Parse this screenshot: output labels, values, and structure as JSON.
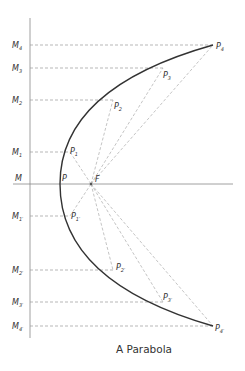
{
  "title": "A Parabola",
  "colors": {
    "curve": "#333333",
    "axis": "#888888",
    "dashed": "#999999",
    "text": "#333333"
  },
  "geometry": {
    "vertex": {
      "x": 60,
      "y": 184
    },
    "focus": {
      "x": 91,
      "y": 184
    },
    "directrix_x": 30,
    "axis_y": 184
  },
  "labels": {
    "vertex": "P",
    "focus": "F",
    "axis_origin": "M",
    "upper": [
      {
        "m": "M",
        "m_sub": "1",
        "p": "P",
        "p_sub": "1",
        "px": 70,
        "y": 152
      },
      {
        "m": "M",
        "m_sub": "2",
        "p": "P",
        "p_sub": "2",
        "px": 113,
        "y": 100
      },
      {
        "m": "M",
        "m_sub": "3",
        "p": "P",
        "p_sub": "3",
        "px": 163,
        "y": 68
      },
      {
        "m": "M",
        "m_sub": "4",
        "p": "P",
        "p_sub": "4",
        "px": 213,
        "y": 45
      }
    ],
    "lower": [
      {
        "m": "M",
        "m_sub": "1′",
        "p": "P",
        "p_sub": "1′",
        "px": 70,
        "y": 216
      },
      {
        "m": "M",
        "m_sub": "2′",
        "p": "P",
        "p_sub": "2′",
        "px": 113,
        "y": 270
      },
      {
        "m": "M",
        "m_sub": "3′",
        "p": "P",
        "p_sub": "3′",
        "px": 163,
        "y": 302
      },
      {
        "m": "M",
        "m_sub": "4′",
        "p": "P",
        "p_sub": "4′",
        "px": 213,
        "y": 326
      }
    ]
  },
  "caption": "A Parabola"
}
